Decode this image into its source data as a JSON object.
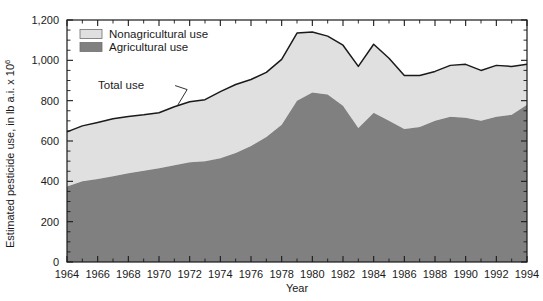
{
  "chart_data": {
    "type": "area",
    "stacked": true,
    "title": "",
    "xlabel": "Year",
    "ylabel": "Estimated pesticide use, in lb a.i. x 10",
    "ylabel_exponent": "6",
    "xlim": [
      1964,
      1994
    ],
    "ylim": [
      0,
      1200
    ],
    "ytick_labels": [
      "0",
      "200",
      "400",
      "600",
      "800",
      "1,000",
      "1,200"
    ],
    "ytick_values": [
      0,
      200,
      400,
      600,
      800,
      1000,
      1200
    ],
    "xtick_labels": [
      "1964",
      "1966",
      "1968",
      "1970",
      "1972",
      "1974",
      "1976",
      "1978",
      "1980",
      "1982",
      "1984",
      "1986",
      "1988",
      "1990",
      "1992",
      "1994"
    ],
    "xtick_values": [
      1964,
      1966,
      1968,
      1970,
      1972,
      1974,
      1976,
      1978,
      1980,
      1982,
      1984,
      1986,
      1988,
      1990,
      1992,
      1994
    ],
    "x": [
      1964,
      1965,
      1966,
      1967,
      1968,
      1969,
      1970,
      1971,
      1972,
      1973,
      1974,
      1975,
      1976,
      1977,
      1978,
      1979,
      1980,
      1981,
      1982,
      1983,
      1984,
      1985,
      1986,
      1987,
      1988,
      1989,
      1990,
      1991,
      1992,
      1993,
      1994
    ],
    "grid": false,
    "legend_position": "upper-left",
    "series": [
      {
        "name": "Agricultural use",
        "color": "#808080",
        "values": [
          375,
          400,
          412,
          425,
          440,
          452,
          465,
          480,
          495,
          500,
          515,
          540,
          575,
          620,
          680,
          800,
          840,
          830,
          775,
          665,
          740,
          700,
          660,
          670,
          700,
          720,
          715,
          700,
          720,
          730,
          780
        ]
      },
      {
        "name": "Nonagricultural use",
        "color": "#e0e0e0",
        "values": [
          270,
          275,
          280,
          285,
          282,
          278,
          275,
          290,
          300,
          305,
          330,
          340,
          330,
          320,
          325,
          335,
          300,
          290,
          300,
          305,
          340,
          310,
          265,
          255,
          245,
          255,
          265,
          250,
          255,
          240,
          200
        ]
      }
    ],
    "total_use": [
      645,
      675,
      692,
      710,
      722,
      730,
      740,
      770,
      795,
      805,
      845,
      880,
      905,
      940,
      1005,
      1135,
      1140,
      1120,
      1075,
      970,
      1080,
      1010,
      925,
      925,
      945,
      975,
      980,
      950,
      975,
      970,
      980
    ],
    "annotations": [
      {
        "text": "Total use",
        "x": 1967.4,
        "y": 860
      }
    ]
  },
  "legend": {
    "items": [
      {
        "label": "Nonagricultural use",
        "color": "#e0e0e0"
      },
      {
        "label": "Agricultural use",
        "color": "#808080"
      }
    ]
  },
  "colors": {
    "agricultural": "#808080",
    "nonagricultural": "#e0e0e0",
    "total_line": "#1a1a1a",
    "axis": "#1a1a1a",
    "background": "#ffffff"
  }
}
